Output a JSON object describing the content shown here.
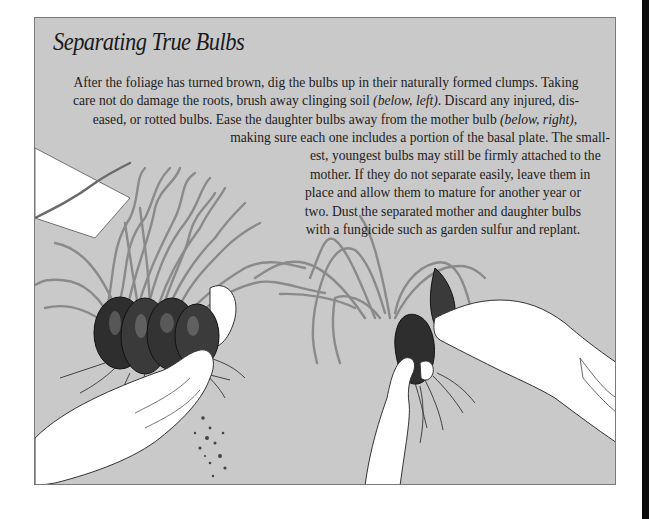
{
  "page": {
    "title": "Separating True Bulbs",
    "paragraph_lines": [
      {
        "text": "After the foliage has turned brown, dig the bulbs up in their naturally formed clumps. Taking"
      },
      {
        "pre": "care not do damage the roots, brush away clinging soil ",
        "em": "(below, left)",
        "post": ". Discard any injured, dis-"
      },
      {
        "pre": "eased, or rotted bulbs. Ease the daughter bulbs away from the mother bulb ",
        "em": "(below, right)",
        "post": ","
      },
      {
        "text": "making sure each one includes a portion of the basal plate. The small-"
      },
      {
        "text": "est, youngest bulbs may still be firmly attached to the"
      },
      {
        "text": "mother. If they do not separate easily, leave them in"
      },
      {
        "text": "place and allow them to mature for another year or"
      },
      {
        "text": "two. Dust the separated mother and daughter bulbs"
      },
      {
        "text": "with a fungicide such as garden sulfur and replant."
      }
    ]
  },
  "illustrations": {
    "left": {
      "label": "hand brushing soil from clump of bulbs"
    },
    "right": {
      "label": "hands easing daughter bulb from mother bulb"
    }
  },
  "colors": {
    "panel_bg": "#c9c9c9",
    "panel_border": "#7a7a7a",
    "text": "#1c1c1c",
    "hand_fill": "#ffffff",
    "bulb_dark": "#2a2a2a",
    "foliage": "#8a8a8a"
  }
}
